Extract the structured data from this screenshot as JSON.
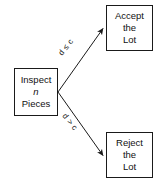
{
  "diagram": {
    "background_color": "#ffffff",
    "stroke_color": "#1a1a1a",
    "text_color": "#111111",
    "nodes": [
      {
        "id": "inspect",
        "lines": [
          "Inspect",
          "n",
          "Pieces"
        ],
        "line1": "Inspect",
        "line2": "n",
        "line3": "Pieces",
        "italic_line": "n"
      },
      {
        "id": "accept",
        "lines": [
          "Accept",
          "the",
          "Lot"
        ],
        "line1": "Accept",
        "line2": "the",
        "line3": "Lot"
      },
      {
        "id": "reject",
        "lines": [
          "Reject",
          "the",
          "Lot"
        ],
        "line1": "Reject",
        "line2": "the",
        "line3": "Lot"
      }
    ],
    "edges": [
      {
        "id": "edge-accept",
        "label": "d ≤ c",
        "from": "inspect",
        "to": "accept"
      },
      {
        "id": "edge-reject",
        "label": "d > c",
        "from": "inspect",
        "to": "reject"
      }
    ]
  }
}
